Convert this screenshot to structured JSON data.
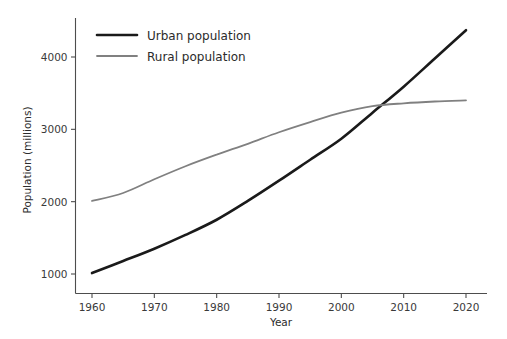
{
  "chart_data": {
    "type": "line",
    "title": "",
    "xlabel": "Year",
    "ylabel": "Population (millions)",
    "xlim": [
      1958,
      2022
    ],
    "ylim": [
      900,
      4500
    ],
    "xticks": [
      1960,
      1970,
      1980,
      1990,
      2000,
      2010,
      2020
    ],
    "xtick_labels": [
      "1960",
      "1970",
      "1980",
      "1990",
      "2000",
      "2010",
      "2020"
    ],
    "yticks": [
      1000,
      2000,
      3000,
      4000
    ],
    "ytick_labels": [
      "1000",
      "2000",
      "3000",
      "4000"
    ],
    "grid": false,
    "legend_position": "upper left",
    "x": [
      1960,
      1965,
      1970,
      1975,
      1980,
      1985,
      1990,
      1995,
      2000,
      2005,
      2010,
      2015,
      2020
    ],
    "series": [
      {
        "name": "Urban population",
        "color": "#1a1a1a",
        "linewidth": 2.6,
        "values": [
          1013,
          1180,
          1350,
          1540,
          1750,
          2010,
          2290,
          2580,
          2870,
          3230,
          3590,
          3980,
          4370
        ]
      },
      {
        "name": "Rural population",
        "color": "#808080",
        "linewidth": 1.8,
        "values": [
          2010,
          2120,
          2310,
          2490,
          2650,
          2800,
          2960,
          3100,
          3230,
          3320,
          3360,
          3385,
          3400
        ]
      }
    ]
  },
  "legend": {
    "entries": [
      {
        "label": "Urban population",
        "color": "#1a1a1a"
      },
      {
        "label": "Rural population",
        "color": "#808080"
      }
    ]
  },
  "axes": {
    "x_title": "Year",
    "y_title": "Population (millions)"
  }
}
